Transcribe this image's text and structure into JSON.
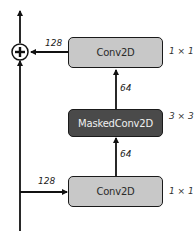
{
  "diagram": {
    "nodes": [
      {
        "id": "conv_top",
        "label": "Conv2D",
        "kernel": "1 × 1",
        "fill": "#c8c8c8"
      },
      {
        "id": "masked_conv",
        "label": "MaskedConv2D",
        "kernel": "3 × 3",
        "fill": "#4a4a4a"
      },
      {
        "id": "conv_bottom",
        "label": "Conv2D",
        "kernel": "1 × 1",
        "fill": "#c8c8c8"
      }
    ],
    "edges": [
      {
        "from": "input",
        "to": "conv_bottom",
        "label": "128"
      },
      {
        "from": "conv_bottom",
        "to": "masked_conv",
        "label": "64"
      },
      {
        "from": "masked_conv",
        "to": "conv_top",
        "label": "64"
      },
      {
        "from": "conv_top",
        "to": "add",
        "label": "128"
      },
      {
        "from": "input",
        "to": "add",
        "label": ""
      },
      {
        "from": "add",
        "to": "output",
        "label": ""
      }
    ],
    "add_symbol": "+"
  }
}
